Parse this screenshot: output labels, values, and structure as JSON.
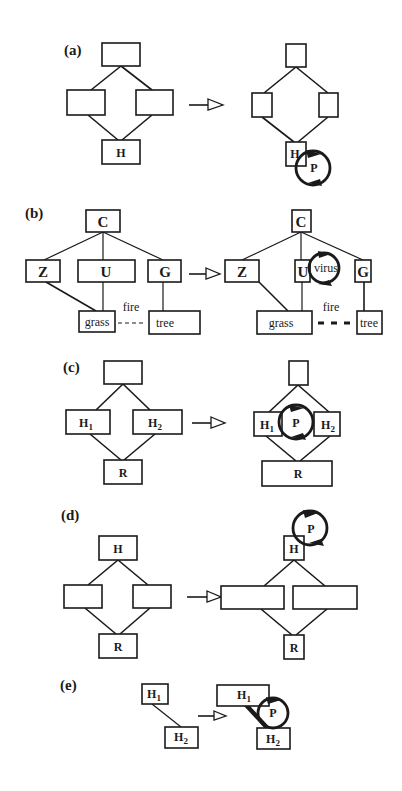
{
  "figure": {
    "panels": [
      {
        "id": "a",
        "label": "(a)",
        "before": {
          "nodes": [
            "",
            "",
            "",
            "H"
          ]
        },
        "after": {
          "nodes": [
            "",
            "",
            "",
            "H"
          ],
          "cycle_label": "P"
        }
      },
      {
        "id": "b",
        "label": "(b)",
        "before": {
          "nodes": [
            "C",
            "Z",
            "U",
            "G",
            "grass",
            "tree"
          ],
          "link_label": "fire"
        },
        "after": {
          "nodes": [
            "C",
            "Z",
            "U",
            "G",
            "grass",
            "tree"
          ],
          "link_label": "fire",
          "cycle_label": "virus"
        }
      },
      {
        "id": "c",
        "label": "(c)",
        "before": {
          "nodes": [
            "",
            "H",
            "H",
            "R"
          ],
          "subscripts": [
            "1",
            "2"
          ]
        },
        "after": {
          "nodes": [
            "",
            "H",
            "H",
            "R"
          ],
          "subscripts": [
            "1",
            "2"
          ],
          "cycle_label": "P"
        }
      },
      {
        "id": "d",
        "label": "(d)",
        "before": {
          "nodes": [
            "H",
            "",
            "",
            "R"
          ]
        },
        "after": {
          "nodes": [
            "H",
            "",
            "",
            "R"
          ],
          "cycle_label": "P"
        }
      },
      {
        "id": "e",
        "label": "(e)",
        "before": {
          "nodes": [
            "H",
            "H"
          ],
          "subscripts": [
            "1",
            "2"
          ]
        },
        "after": {
          "nodes": [
            "H",
            "H"
          ],
          "subscripts": [
            "1",
            "2"
          ],
          "cycle_label": "P"
        }
      }
    ]
  }
}
